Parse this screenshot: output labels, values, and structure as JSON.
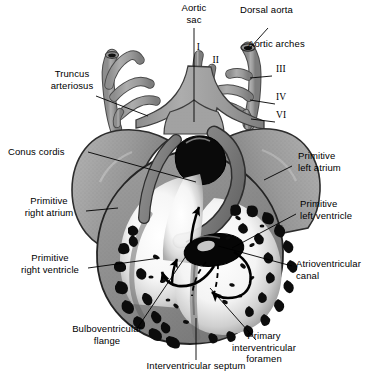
{
  "figure": {
    "type": "anatomical-diagram",
    "width": 378,
    "height": 383,
    "background": "#ffffff",
    "ink": "#000000",
    "tissue_gray": "#9a9a9a",
    "tissue_dark": "#6e6e6e",
    "tissue_light": "#b8b8b8",
    "lumen_black": "#0a0a0a",
    "cavity_white": "#f2f2f2"
  },
  "labels": {
    "aortic_sac": "Aortic\nsac",
    "dorsal_aorta": "Dorsal aorta",
    "aortic_arches": "Aortic arches",
    "truncus_arteriosus": "Truncus\narteriosus",
    "conus_cordis": "Conus cordis",
    "primitive_right_atrium": "Primitive\nright atrium",
    "primitive_right_ventricle": "Primitive\nright ventricle",
    "bulboventricular_flange": "Bulboventricular\nflange",
    "interventricular_septum": "Interventricular septum",
    "primitive_left_atrium": "Primitive\nleft atrium",
    "primitive_left_ventricle": "Primitive\nleft ventricle",
    "atrioventricular_canal": "Atrioventricular\ncanal",
    "primary_interventricular_foramen": "Primary\ninterventricular\nforamen"
  },
  "arch_numerals": {
    "arch_1": "I",
    "arch_2": "II",
    "arch_3": "III",
    "arch_4": "IV",
    "arch_6": "VI"
  }
}
